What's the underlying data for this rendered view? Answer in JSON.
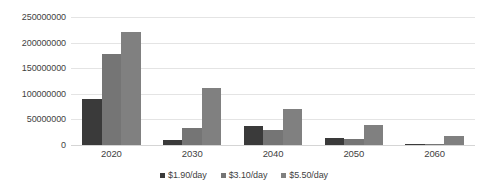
{
  "chart_data": {
    "type": "bar",
    "title": "",
    "subtitle": "",
    "xlabel": "",
    "ylabel": "",
    "categories": [
      "2020",
      "2030",
      "2040",
      "2050",
      "2060"
    ],
    "series": [
      {
        "name": "$1.90/day",
        "color": "#3a3a3a",
        "values": [
          90000000,
          10000000,
          38000000,
          13000000,
          2000000
        ]
      },
      {
        "name": "$3.10/day",
        "color": "#757575",
        "values": [
          178000000,
          33000000,
          30000000,
          12000000,
          1500000
        ]
      },
      {
        "name": "$5.50/day",
        "color": "#808080",
        "values": [
          220000000,
          112000000,
          70000000,
          40000000,
          18000000
        ]
      }
    ],
    "ylim": [
      0,
      250000000
    ],
    "yticks": [
      0,
      50000000,
      100000000,
      150000000,
      200000000,
      250000000
    ],
    "ytick_labels": [
      "0",
      "50000000",
      "100000000",
      "150000000",
      "200000000",
      "250000000"
    ],
    "grid": true,
    "grid_axis": "y",
    "legend_position": "bottom",
    "legend": [
      "$1.90/day",
      "$3.10/day",
      "$5.50/day"
    ]
  }
}
